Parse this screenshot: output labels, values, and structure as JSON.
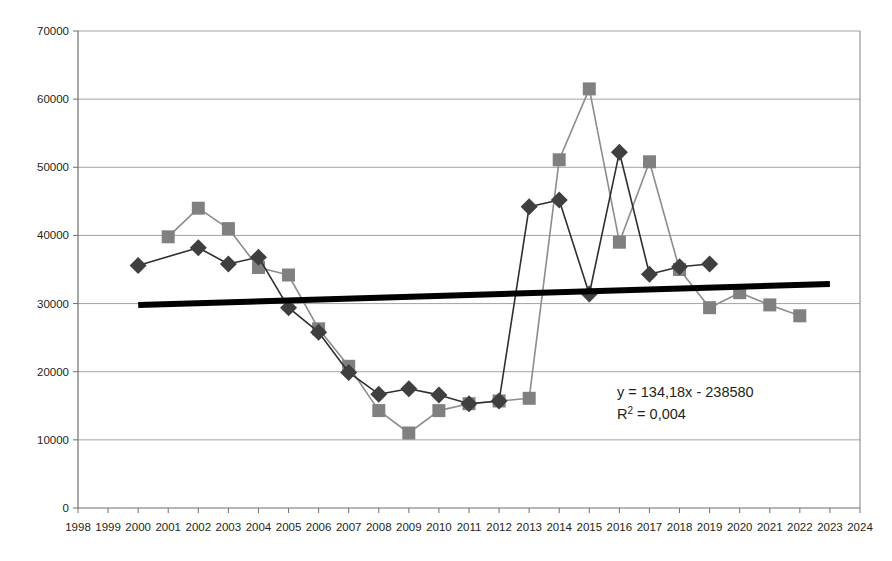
{
  "chart_data": {
    "type": "line",
    "title": "",
    "subtitle": "",
    "xlabel": "",
    "ylabel": "",
    "xlim": [
      1998,
      2024
    ],
    "ylim": [
      0,
      70000
    ],
    "ytick_step": 10000,
    "grid": true,
    "legend": false,
    "legend_position": "none",
    "x_tick_labels": [
      "1998",
      "1999",
      "2000",
      "2001",
      "2002",
      "2003",
      "2004",
      "2005",
      "2006",
      "2007",
      "2008",
      "2009",
      "2010",
      "2011",
      "2012",
      "2013",
      "2014",
      "2015",
      "2016",
      "2017",
      "2018",
      "2019",
      "2020",
      "2021",
      "2022",
      "2023",
      "2024"
    ],
    "y_tick_labels": [
      "0",
      "10000",
      "20000",
      "30000",
      "40000",
      "50000",
      "60000",
      "70000"
    ],
    "y_tick_values": [
      0,
      10000,
      20000,
      30000,
      40000,
      50000,
      60000,
      70000
    ],
    "series": [
      {
        "name": "series-gray-square",
        "marker": "square",
        "color": "#808080",
        "line_color": "#8c8c8c",
        "x": [
          2001,
          2002,
          2003,
          2004,
          2005,
          2006,
          2007,
          2008,
          2009,
          2010,
          2011,
          2012,
          2013,
          2014,
          2015,
          2016,
          2017,
          2018,
          2019,
          2020,
          2021,
          2022
        ],
        "values": [
          39800,
          44000,
          41000,
          35300,
          34200,
          26300,
          20800,
          14300,
          11000,
          14300,
          15300,
          15700,
          16100,
          51100,
          61500,
          39000,
          50800,
          35000,
          29400,
          31600,
          29800,
          28200
        ]
      },
      {
        "name": "series-dark-diamond",
        "marker": "diamond",
        "color": "#3f3f3f",
        "line_color": "#2f2f2f",
        "x": [
          2000,
          2002,
          2003,
          2004,
          2005,
          2006,
          2007,
          2008,
          2009,
          2010,
          2011,
          2012,
          2013,
          2014,
          2015,
          2016,
          2017,
          2018,
          2019
        ],
        "values": [
          35600,
          38200,
          35800,
          36800,
          29400,
          25800,
          19900,
          16700,
          17500,
          16600,
          15300,
          15700,
          44200,
          45200,
          31400,
          52200,
          34300,
          35400,
          35800
        ]
      }
    ],
    "trendline": {
      "name": "linear-trendline",
      "color": "#000000",
      "equation": "y = 134,18x - 238580",
      "r_squared_label": "R² = 0,004",
      "r_squared_prefix": "R",
      "r_squared_sup": "2",
      "r_squared_suffix": " = 0,004",
      "slope": 134.18,
      "intercept": -238580,
      "x_start": 2000,
      "x_end": 2023,
      "y_start": 29780,
      "y_end": 32867
    },
    "annotations": [
      {
        "name": "trendline-equation-annotation",
        "line1": "y = 134,18x - 238580",
        "line2": "R² = 0,004",
        "x_px": 617,
        "y_px": 397
      }
    ]
  }
}
